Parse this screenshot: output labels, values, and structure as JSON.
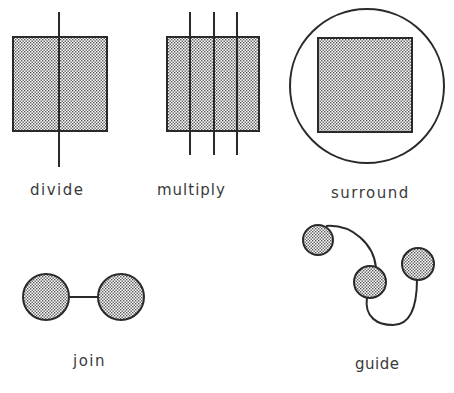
{
  "figures": [
    {
      "id": "divide",
      "label": "divide"
    },
    {
      "id": "multiply",
      "label": "multiply"
    },
    {
      "id": "surround",
      "label": "surround"
    },
    {
      "id": "join",
      "label": "join"
    },
    {
      "id": "guide",
      "label": "guide"
    }
  ],
  "colors": {
    "stroke": "#2a2a2a",
    "fill_dots": "#555555",
    "background": "#ffffff",
    "text": "#3a3a3a"
  }
}
